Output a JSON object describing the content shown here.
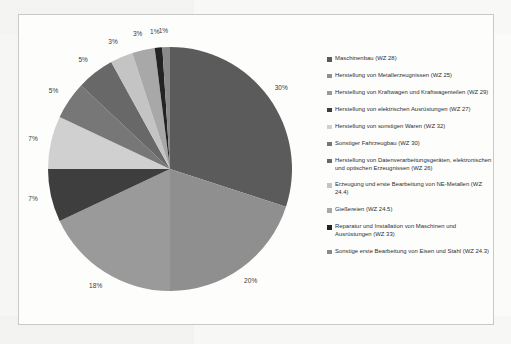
{
  "chart_data": {
    "type": "pie",
    "title": "",
    "legend_position": "right",
    "categories": [
      "Maschinenbau (WZ 28)",
      "Herstellung von Metallerzeugnissen (WZ 25)",
      "Herstellung von Kraftwagen und Kraftwagenteilen (WZ 29)",
      "Herstellung von elektrischen Ausrüstungen (WZ 27)",
      "Herstellung von sonstigen Waren (WZ 32)",
      "Sonstiger Fahrzeugbau (WZ 30)",
      "Herstellung von Datenverarbeitungsgeräten, elektronischen und optischen Erzeugnissen (WZ 26)",
      "Erzeugung und erste Bearbeitung von NE-Metallen (WZ 24.4)",
      "Gießereien (WZ 24.5)",
      "Reparatur und Installation von Maschinen und Ausrüstungen (WZ 33)",
      "Sonstige erste Bearbeitung von Eisen und Stahl (WZ 24.3)"
    ],
    "values": [
      30,
      20,
      18,
      7,
      7,
      5,
      5,
      3,
      3,
      1,
      1
    ],
    "value_labels": [
      "30%",
      "20%",
      "18%",
      "7%",
      "7%",
      "5%",
      "5%",
      "3%",
      "3%",
      "1%",
      "1%"
    ],
    "colors": [
      "#5b5b5b",
      "#8f8f8f",
      "#9a9a9a",
      "#3e3e3e",
      "#d0d0d0",
      "#777777",
      "#686868",
      "#c4c4c4",
      "#a8a8a8",
      "#232323",
      "#8a8a8a"
    ],
    "xlabel": "",
    "ylabel": ""
  },
  "legend": {
    "items": [
      {
        "label": "Maschinenbau (WZ 28)",
        "color": "#5b5b5b"
      },
      {
        "label": "Herstellung von Metallerzeugnissen (WZ 25)",
        "color": "#8f8f8f"
      },
      {
        "label": "Herstellung von Kraftwagen und Kraftwagenteilen (WZ 29)",
        "color": "#9a9a9a"
      },
      {
        "label": "Herstellung von elektrischen Ausrüstungen (WZ 27)",
        "color": "#3e3e3e"
      },
      {
        "label": "Herstellung von sonstigen Waren (WZ 32)",
        "color": "#d0d0d0"
      },
      {
        "label": "Sonstiger Fahrzeugbau (WZ 30)",
        "color": "#777777"
      },
      {
        "label": "Herstellung von Datenverarbeitungsgeräten, elektronischen und optischen Erzeugnissen (WZ 26)",
        "color": "#686868"
      },
      {
        "label": "Erzeugung und erste Bearbeitung von NE-Metallen (WZ 24.4)",
        "color": "#c4c4c4"
      },
      {
        "label": "Gießereien (WZ 24.5)",
        "color": "#a8a8a8"
      },
      {
        "label": "Reparatur und Installation von Maschinen und Ausrüstungen (WZ 33)",
        "color": "#232323"
      },
      {
        "label": "Sonstige erste Bearbeitung von Eisen und Stahl (WZ 24.3)",
        "color": "#8a8a8a"
      }
    ]
  }
}
